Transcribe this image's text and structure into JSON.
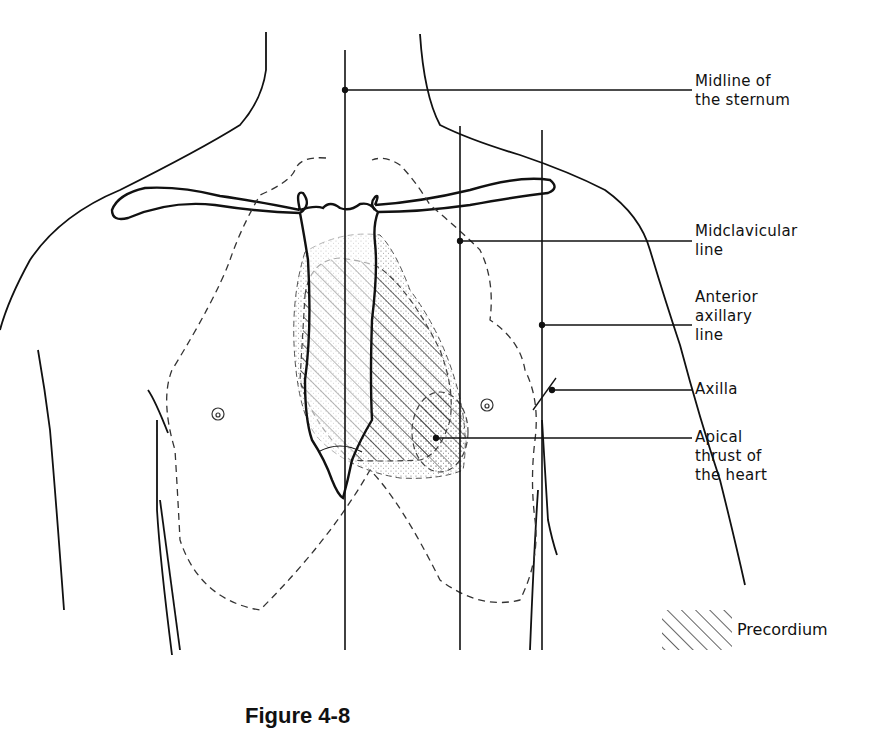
{
  "figure": {
    "caption": "Figure 4-8",
    "labels": {
      "midline": {
        "line1": "Midline of",
        "line2": "the sternum"
      },
      "midclavicular": {
        "line1": "Midclavicular",
        "line2": "line"
      },
      "anterior_axillary": {
        "line1": "Anterior",
        "line2": "axillary",
        "line3": "line"
      },
      "axilla": {
        "line1": "Axilla"
      },
      "apical": {
        "line1": "Apical",
        "line2": "thrust of",
        "line3": "the heart"
      }
    },
    "legend": {
      "pattern": "diagonal-hatch",
      "label": "Precordium"
    },
    "colors": {
      "ink": "#111111",
      "background": "#ffffff",
      "stipple": "#888888"
    }
  }
}
